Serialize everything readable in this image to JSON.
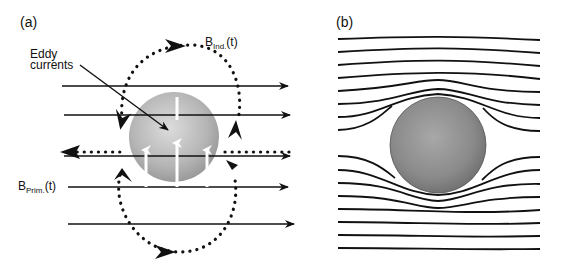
{
  "panel_a": {
    "label": "(a)",
    "eddy_label_line1": "Eddy",
    "eddy_label_line2": "currents",
    "b_ind_main": "B",
    "b_ind_sub": "Ind.",
    "b_ind_suffix": "(t)",
    "b_prim_main": "B",
    "b_prim_sub": "Prim.",
    "b_prim_suffix": "(t)"
  },
  "panel_b": {
    "label": "(b)"
  },
  "colors": {
    "line": "#111111",
    "sphere_light": "#cfcfcf",
    "sphere_dark": "#7a7a7a"
  }
}
